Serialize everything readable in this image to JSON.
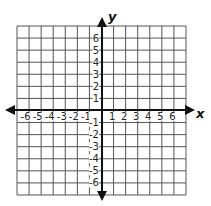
{
  "diagram": {
    "type": "coordinate-plane",
    "x_axis_label": "x",
    "y_axis_label": "y",
    "x_range": [
      -7,
      7
    ],
    "y_range": [
      -7,
      7
    ],
    "grid_step": 1,
    "x_tick_labels": [
      "-6",
      "-5",
      "-4",
      "-3",
      "-2",
      "-1",
      "1",
      "2",
      "3",
      "4",
      "5",
      "6"
    ],
    "y_tick_labels": [
      "6",
      "5",
      "4",
      "3",
      "2",
      "1",
      "-1",
      "-2",
      "-3",
      "-4",
      "-5",
      "-6"
    ],
    "colors": {
      "grid": "#555555",
      "axis": "#111111",
      "background": "#ffffff"
    }
  }
}
